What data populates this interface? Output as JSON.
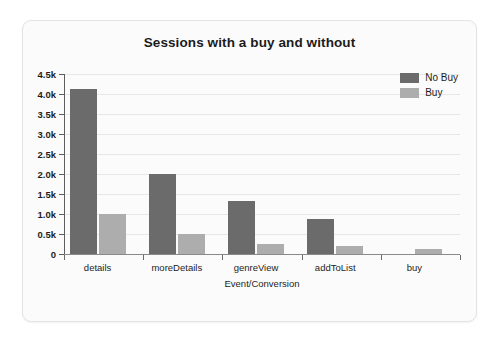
{
  "panel": {
    "background_color": "#fbfbfb",
    "border_color": "#e3e3e3"
  },
  "chart_data": {
    "type": "bar",
    "title": "Sessions with a buy and without",
    "xlabel": "Event/Conversion",
    "ylabel": "",
    "categories": [
      "details",
      "moreDetails",
      "genreView",
      "addToList",
      "buy"
    ],
    "series": [
      {
        "name": "No Buy",
        "color": "#6b6b6b",
        "values": [
          4120,
          2000,
          1320,
          880,
          0
        ]
      },
      {
        "name": "Buy",
        "color": "#adadad",
        "values": [
          1000,
          500,
          260,
          200,
          120
        ]
      }
    ],
    "ylim": [
      0,
      4500
    ],
    "ytick_values": [
      0,
      500,
      1000,
      1500,
      2000,
      2500,
      3000,
      3500,
      4000,
      4500
    ],
    "ytick_labels": [
      "0",
      "0.5k",
      "1.0k",
      "1.5k",
      "2.0k",
      "2.5k",
      "3.0k",
      "3.5k",
      "4.0k",
      "4.5k"
    ],
    "grid": true,
    "legend_position": "top-right",
    "legend_entries": [
      "No Buy",
      "Buy"
    ]
  }
}
